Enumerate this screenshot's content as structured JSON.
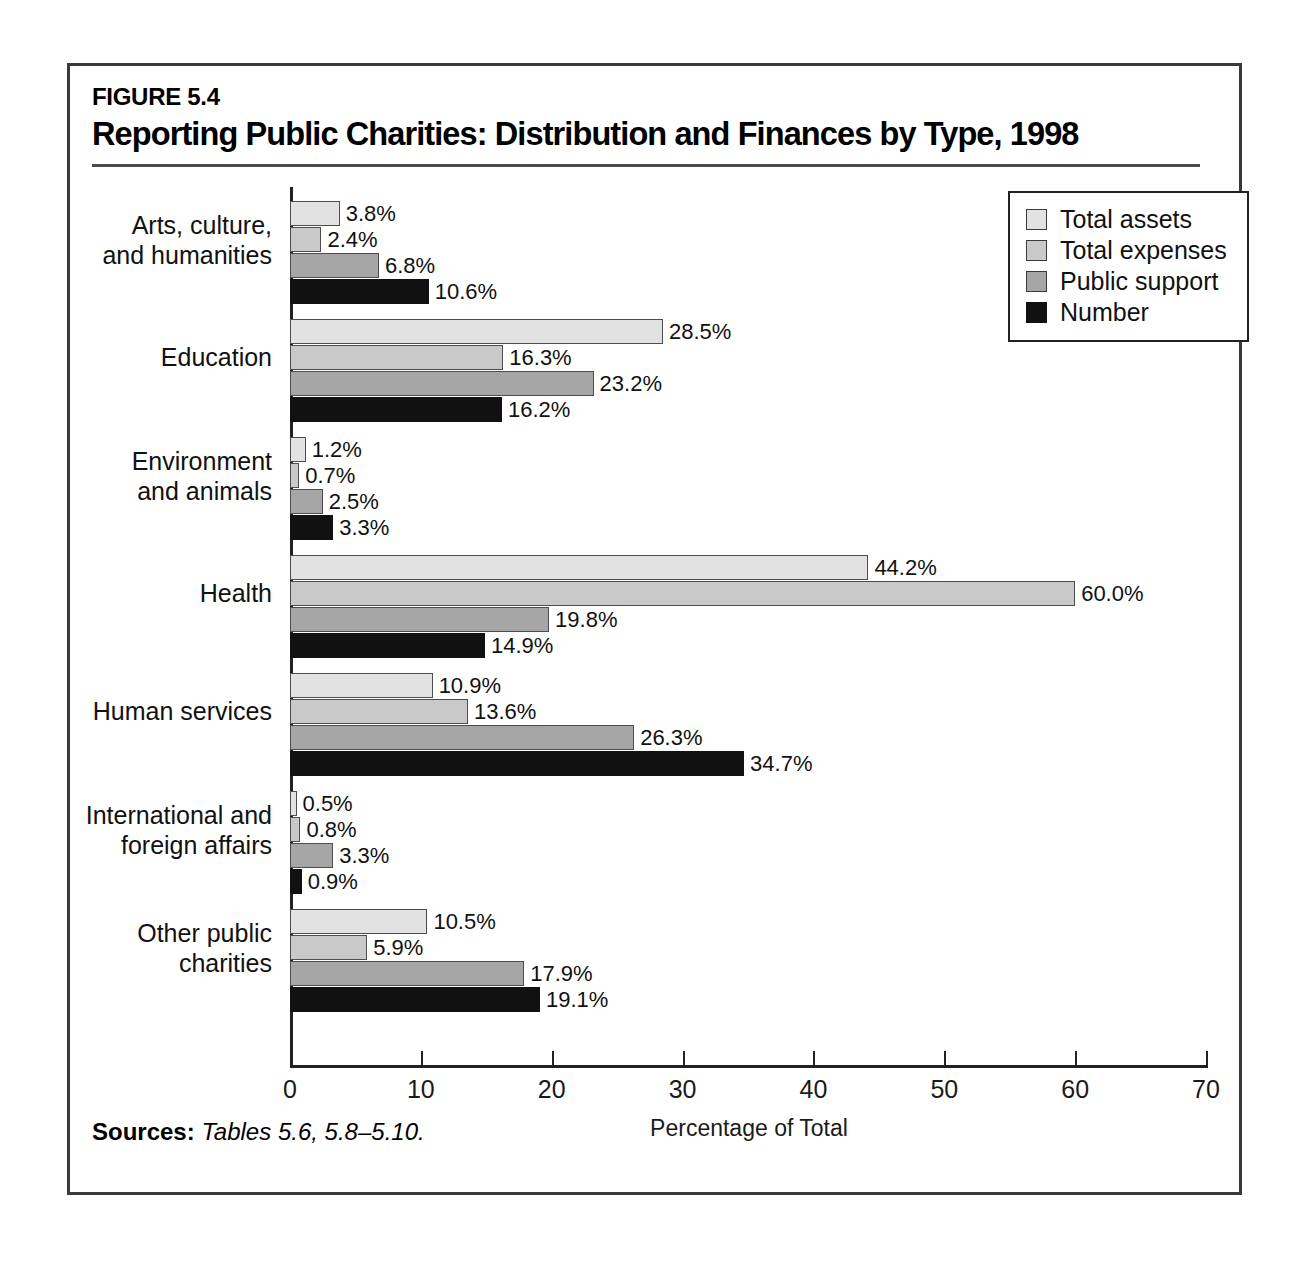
{
  "figure": {
    "number": "FIGURE 5.4",
    "title": "Reporting Public Charities: Distribution and Finances by Type, 1998",
    "sources_label": "Sources:",
    "sources_text": "Tables 5.6, 5.8–5.10."
  },
  "legend": {
    "entries": [
      {
        "label": "Total assets",
        "color": "#e2e2e2"
      },
      {
        "label": "Total expenses",
        "color": "#c9c9c9"
      },
      {
        "label": "Public support",
        "color": "#a6a6a6"
      },
      {
        "label": "Number",
        "color": "#111111"
      }
    ]
  },
  "chart_data": {
    "type": "bar",
    "orientation": "horizontal",
    "title": "Reporting Public Charities: Distribution and Finances by Type, 1998",
    "xlabel": "Percentage of Total",
    "ylabel": "",
    "xlim": [
      0,
      70
    ],
    "xticks": [
      0,
      10,
      20,
      30,
      40,
      50,
      60,
      70
    ],
    "xtick_labels": [
      "0",
      "10",
      "20",
      "30",
      "40",
      "50",
      "60",
      "70"
    ],
    "grid": false,
    "legend_position": "top-right",
    "value_suffix": "%",
    "categories": [
      "Arts, culture,\nand humanities",
      "Education",
      "Environment\nand animals",
      "Health",
      "Human services",
      "International and\nforeign affairs",
      "Other public\ncharities"
    ],
    "category_lines": [
      [
        "Arts, culture,",
        "and humanities"
      ],
      [
        "Education"
      ],
      [
        "Environment",
        "and animals"
      ],
      [
        "Health"
      ],
      [
        "Human services"
      ],
      [
        "International and",
        "foreign affairs"
      ],
      [
        "Other public",
        "charities"
      ]
    ],
    "series": [
      {
        "name": "Total assets",
        "color": "#e2e2e2",
        "values": [
          3.8,
          28.5,
          1.2,
          44.2,
          10.9,
          0.5,
          10.5
        ]
      },
      {
        "name": "Total expenses",
        "color": "#c9c9c9",
        "values": [
          2.4,
          16.3,
          0.7,
          60.0,
          13.6,
          0.8,
          5.9
        ]
      },
      {
        "name": "Public support",
        "color": "#a6a6a6",
        "values": [
          6.8,
          23.2,
          2.5,
          19.8,
          26.3,
          3.3,
          17.9
        ]
      },
      {
        "name": "Number",
        "color": "#111111",
        "values": [
          10.6,
          16.2,
          3.3,
          14.9,
          34.7,
          0.9,
          19.1
        ]
      }
    ],
    "value_labels": [
      [
        "3.8%",
        "2.4%",
        "6.8%",
        "10.6%"
      ],
      [
        "28.5%",
        "16.3%",
        "23.2%",
        "16.2%"
      ],
      [
        "1.2%",
        "0.7%",
        "2.5%",
        "3.3%"
      ],
      [
        "44.2%",
        "60.0%",
        "19.8%",
        "14.9%"
      ],
      [
        "10.9%",
        "13.6%",
        "26.3%",
        "34.7%"
      ],
      [
        "0.5%",
        "0.8%",
        "3.3%",
        "0.9%"
      ],
      [
        "10.5%",
        "5.9%",
        "17.9%",
        "19.1%"
      ]
    ]
  }
}
